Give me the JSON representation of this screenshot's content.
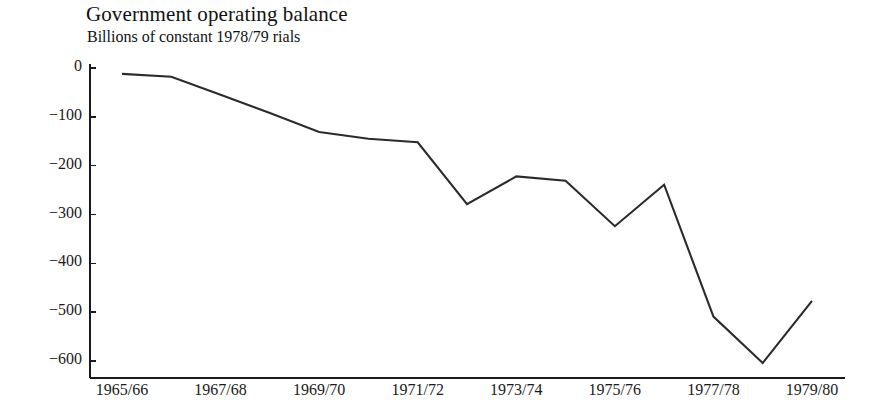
{
  "chart_data": {
    "type": "line",
    "title": "Government operating balance",
    "subtitle": "Billions of constant 1978/79 rials",
    "xlabel": "",
    "ylabel": "",
    "categories": [
      "1965/66",
      "1966/67",
      "1967/68",
      "1968/69",
      "1969/70",
      "1970/71",
      "1971/72",
      "1972/73",
      "1973/74",
      "1974/75",
      "1975/76",
      "1976/77",
      "1977/78",
      "1978/79",
      "1979/80"
    ],
    "values": [
      -12,
      -18,
      -55,
      -92,
      -131,
      -145,
      -152,
      -279,
      -222,
      -231,
      -324,
      -239,
      -509,
      -604,
      -477
    ],
    "x_tick_labels": [
      "1965/66",
      "1967/68",
      "1969/70",
      "1971/72",
      "1973/74",
      "1975/76",
      "1977/78",
      "1979/80"
    ],
    "y_tick_labels": [
      "0",
      "−100",
      "−200",
      "−300",
      "−400",
      "−500",
      "−600"
    ],
    "y_tick_values": [
      0,
      -100,
      -200,
      -300,
      -400,
      -500,
      -600
    ],
    "ylim": [
      -650,
      10
    ],
    "xlim": [
      "1965/66",
      "1979/80"
    ],
    "grid": false,
    "legend": false,
    "series": [
      {
        "name": "Government operating balance",
        "color": "#2b2b2b",
        "values": [
          -12,
          -18,
          -55,
          -92,
          -131,
          -145,
          -152,
          -279,
          -222,
          -231,
          -324,
          -239,
          -509,
          -604,
          -477
        ]
      }
    ]
  },
  "colors": {
    "line": "#2b2b2b",
    "axis": "#1a1a1a",
    "background": "#ffffff",
    "text": "#1a1a1a"
  }
}
